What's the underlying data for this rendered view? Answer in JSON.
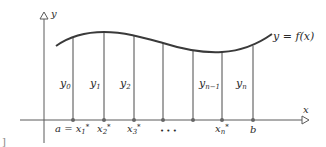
{
  "diagram": {
    "type": "riemann-sum-ordinates",
    "colors": {
      "curve": "#3a3a3a",
      "axis": "#5a5a5a",
      "ordinate": "#4a4a4a",
      "point": "#666666",
      "text": "#2a2a2a"
    },
    "axes": {
      "x_label": "x",
      "y_label": "y"
    },
    "curve_label": "y = f(x)",
    "ordinate_labels": [
      {
        "base": "y",
        "sub": "0"
      },
      {
        "base": "y",
        "sub": "1"
      },
      {
        "base": "y",
        "sub": "2"
      },
      {
        "base": "y",
        "sub": "n−1"
      },
      {
        "base": "y",
        "sub": "n"
      }
    ],
    "x_labels": [
      {
        "text": "a = x",
        "sub": "1",
        "sup": "*"
      },
      {
        "text": "x",
        "sub": "2",
        "sup": "*"
      },
      {
        "text": "x",
        "sub": "3",
        "sup": "*"
      },
      {
        "text": "• • •"
      },
      {
        "text": "x",
        "sub": "n",
        "sup": "*"
      },
      {
        "text": "b"
      }
    ],
    "margin_mark": "]"
  }
}
